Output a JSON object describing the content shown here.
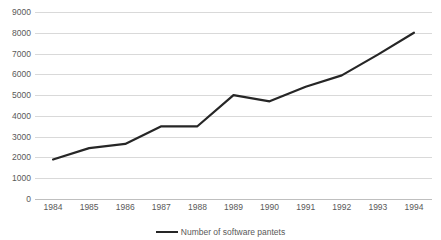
{
  "chart_data": {
    "type": "line",
    "title": "",
    "subtitle": "",
    "xlabel": "",
    "ylabel": "",
    "categories": [
      "1984",
      "1985",
      "1986",
      "1987",
      "1988",
      "1989",
      "1990",
      "1991",
      "1992",
      "1993",
      "1994"
    ],
    "series": [
      {
        "name": "Number of software pantets",
        "values": [
          1900,
          2450,
          2650,
          3500,
          3500,
          5000,
          4700,
          5400,
          5950,
          6950,
          8000
        ],
        "color": "#262626"
      }
    ],
    "ylim": [
      0,
      9000
    ],
    "ytick_values": [
      0,
      1000,
      2000,
      3000,
      4000,
      5000,
      6000,
      7000,
      8000,
      9000
    ],
    "ytick_labels": [
      "0",
      "1000",
      "2000",
      "3000",
      "4000",
      "5000",
      "6000",
      "7000",
      "8000",
      "9000"
    ],
    "grid": true,
    "grid_color": "#d9d9d9",
    "legend_position": "bottom",
    "legend": [
      "Number of software pantets"
    ],
    "background_color": "#ffffff",
    "tick_label_color": "#595959"
  },
  "legend": {
    "entry_label": "Number of software pantets"
  }
}
